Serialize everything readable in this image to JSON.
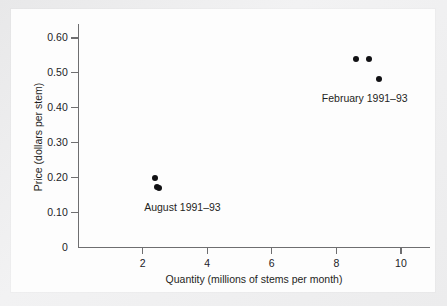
{
  "figure": {
    "background_color": "#ececed",
    "paper_color": "#fdfdfd",
    "axis_color": "#6e6e70",
    "point_color": "#111114"
  },
  "chart_data": {
    "type": "scatter",
    "title": "",
    "xlabel": "Quantity (millions of stems per month)",
    "ylabel": "Price (dollars per stem)",
    "xlim": [
      0,
      10.9
    ],
    "ylim": [
      0,
      0.64
    ],
    "grid": false,
    "legend_position": "none",
    "x_ticks": [
      2,
      4,
      6,
      8,
      10
    ],
    "x_tick_labels": [
      "2",
      "4",
      "6",
      "8",
      "10"
    ],
    "y_ticks": [
      0.1,
      0.2,
      0.3,
      0.4,
      0.5,
      0.6
    ],
    "y_tick_labels": [
      "0.10",
      "0.20",
      "0.30",
      "0.40",
      "0.50",
      "0.60"
    ],
    "origin_label": "0",
    "series": [
      {
        "name": "August 1991–93",
        "annotation": "August 1991–93",
        "annotation_x": 2.05,
        "annotation_y": 0.112,
        "points": [
          {
            "x": 2.38,
            "y": 0.198
          },
          {
            "x": 2.44,
            "y": 0.173
          },
          {
            "x": 2.52,
            "y": 0.17
          }
        ]
      },
      {
        "name": "February 1991–93",
        "annotation": "February 1991–93",
        "annotation_x": 7.55,
        "annotation_y": 0.425,
        "points": [
          {
            "x": 8.6,
            "y": 0.54
          },
          {
            "x": 9.0,
            "y": 0.54
          },
          {
            "x": 9.32,
            "y": 0.482
          }
        ]
      }
    ]
  }
}
